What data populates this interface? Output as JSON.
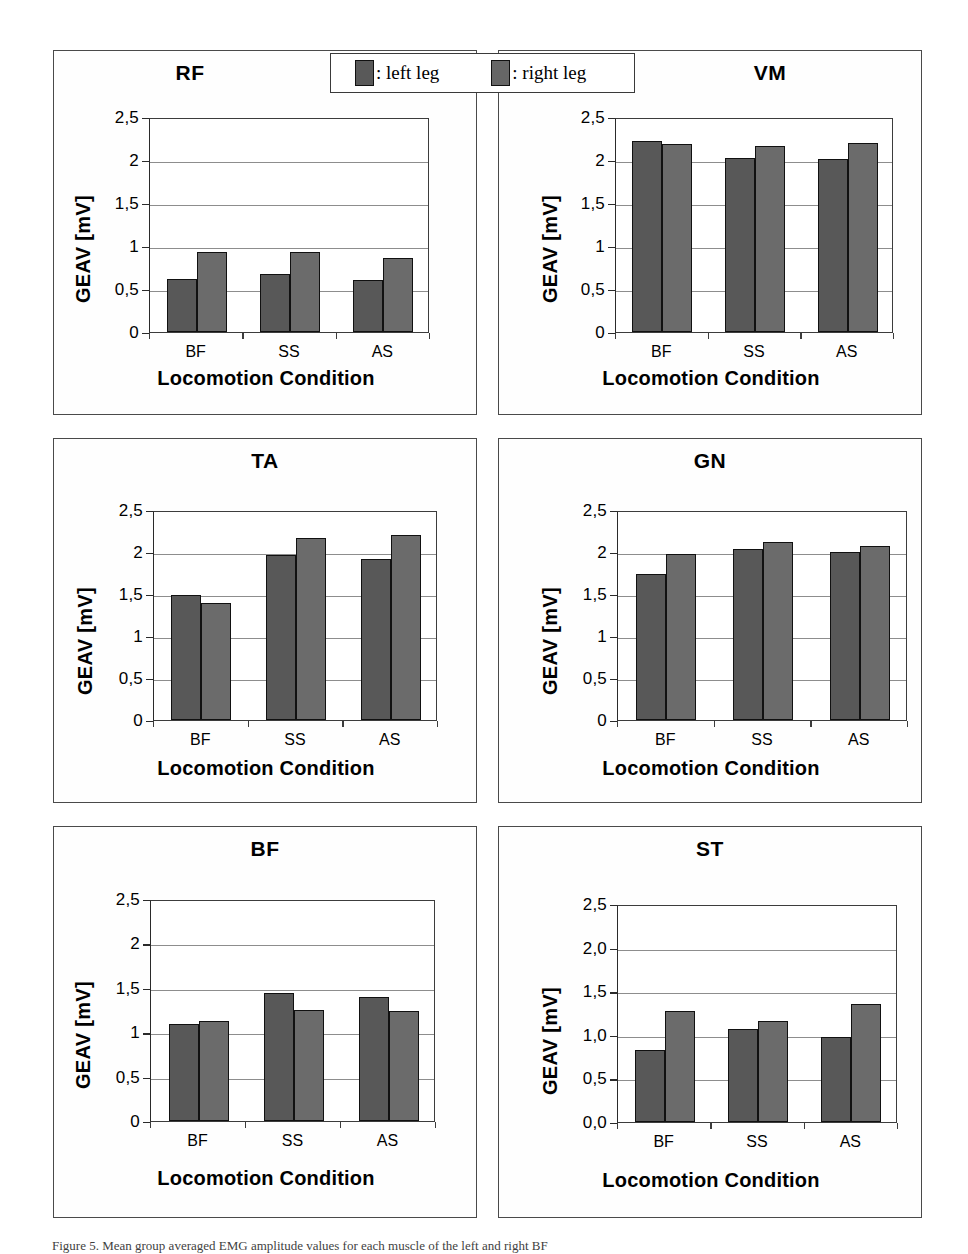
{
  "figure": {
    "legend": {
      "left_label": ": left leg",
      "right_label": ": right leg",
      "left_color": "#585858",
      "right_color": "#6b6b6b"
    },
    "caption": "Figure 5. Mean group averaged EMG amplitude values for each muscle of the left and right BF"
  },
  "chart_data": [
    {
      "type": "bar",
      "title": "RF",
      "xlabel": "Locomotion Condition",
      "ylabel": "GEAV  [mV]",
      "categories": [
        "BF",
        "SS",
        "AS"
      ],
      "ytick_labels": [
        "0",
        "0,5",
        "1",
        "1,5",
        "2",
        "2,5"
      ],
      "ytick_values": [
        0,
        0.5,
        1,
        1.5,
        2,
        2.5
      ],
      "ylim": [
        0,
        2.5
      ],
      "grid": true,
      "legend_position": "top-center-shared",
      "series": [
        {
          "name": "left leg",
          "values": [
            0.62,
            0.68,
            0.61
          ]
        },
        {
          "name": "right leg",
          "values": [
            0.93,
            0.93,
            0.86
          ]
        }
      ]
    },
    {
      "type": "bar",
      "title": "VM",
      "xlabel": "Locomotion Condition",
      "ylabel": "GEAV  [mV]",
      "categories": [
        "BF",
        "SS",
        "AS"
      ],
      "ytick_labels": [
        "0",
        "0,5",
        "1",
        "1,5",
        "2",
        "2,5"
      ],
      "ytick_values": [
        0,
        0.5,
        1,
        1.5,
        2,
        2.5
      ],
      "ylim": [
        0,
        2.5
      ],
      "grid": true,
      "legend_position": "top-center-shared",
      "series": [
        {
          "name": "left leg",
          "values": [
            2.22,
            2.02,
            2.01
          ]
        },
        {
          "name": "right leg",
          "values": [
            2.19,
            2.16,
            2.2
          ]
        }
      ]
    },
    {
      "type": "bar",
      "title": "TA",
      "xlabel": "Locomotion Condition",
      "ylabel": "GEAV  [mV]",
      "categories": [
        "BF",
        "SS",
        "AS"
      ],
      "ytick_labels": [
        "0",
        "0,5",
        "1",
        "1,5",
        "2",
        "2,5"
      ],
      "ytick_values": [
        0,
        0.5,
        1,
        1.5,
        2,
        2.5
      ],
      "ylim": [
        0,
        2.5
      ],
      "grid": true,
      "legend_position": "top-center-shared",
      "series": [
        {
          "name": "left leg",
          "values": [
            1.49,
            1.96,
            1.92
          ]
        },
        {
          "name": "right leg",
          "values": [
            1.39,
            2.17,
            2.2
          ]
        }
      ]
    },
    {
      "type": "bar",
      "title": "GN",
      "xlabel": "Locomotion Condition",
      "ylabel": "GEAV  [mV]",
      "categories": [
        "BF",
        "SS",
        "AS"
      ],
      "ytick_labels": [
        "0",
        "0,5",
        "1",
        "1,5",
        "2",
        "2,5"
      ],
      "ytick_values": [
        0,
        0.5,
        1,
        1.5,
        2,
        2.5
      ],
      "ylim": [
        0,
        2.5
      ],
      "grid": true,
      "legend_position": "top-center-shared",
      "series": [
        {
          "name": "left leg",
          "values": [
            1.74,
            2.03,
            2.0
          ]
        },
        {
          "name": "right leg",
          "values": [
            1.98,
            2.12,
            2.07
          ]
        }
      ]
    },
    {
      "type": "bar",
      "title": "BF",
      "xlabel": "Locomotion Condition",
      "ylabel": "GEAV  [mV]",
      "categories": [
        "BF",
        "SS",
        "AS"
      ],
      "ytick_labels": [
        "0",
        "0,5",
        "1",
        "1,5",
        "2",
        "2,5"
      ],
      "ytick_values": [
        0,
        0.5,
        1,
        1.5,
        2,
        2.5
      ],
      "ylim": [
        0,
        2.5
      ],
      "grid": true,
      "legend_position": "top-center-shared",
      "series": [
        {
          "name": "left leg",
          "values": [
            1.09,
            1.44,
            1.4
          ]
        },
        {
          "name": "right leg",
          "values": [
            1.13,
            1.25,
            1.24
          ]
        }
      ]
    },
    {
      "type": "bar",
      "title": "ST",
      "xlabel": "Locomotion Condition",
      "ylabel": "GEAV  [mV]",
      "categories": [
        "BF",
        "SS",
        "AS"
      ],
      "ytick_labels": [
        "0,0",
        "0,5",
        "1,0",
        "1,5",
        "2,0",
        "2,5"
      ],
      "ytick_values": [
        0,
        0.5,
        1,
        1.5,
        2,
        2.5
      ],
      "ylim": [
        0,
        2.5
      ],
      "grid": true,
      "legend_position": "top-center-shared",
      "series": [
        {
          "name": "left leg",
          "values": [
            0.83,
            1.07,
            0.98
          ]
        },
        {
          "name": "right leg",
          "values": [
            1.27,
            1.16,
            1.35
          ]
        }
      ]
    }
  ]
}
